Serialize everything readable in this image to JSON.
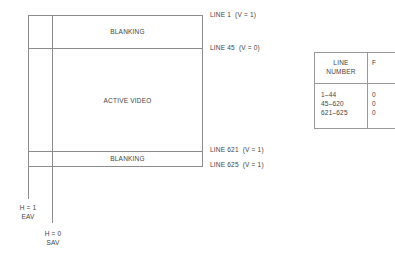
{
  "diagram": {
    "regions": {
      "top_blanking": "BLANKING",
      "active_video": "ACTIVE VIDEO",
      "bottom_blanking": "BLANKING"
    },
    "line_labels": [
      "LINE 1  (V = 1)",
      "LINE 45  (V = 0)",
      "LINE 621  (V = 1)",
      "LINE 625  (V = 1)"
    ],
    "h_markers": [
      {
        "value": "H = 1",
        "name": "EAV"
      },
      {
        "value": "H = 0",
        "name": "SAV"
      }
    ]
  },
  "table": {
    "headers": [
      "LINE NUMBER",
      "F"
    ],
    "header_line1": "LINE",
    "header_line2": "NUMBER",
    "rows": [
      {
        "line_number": "1–44",
        "f": "0"
      },
      {
        "line_number": "45–620",
        "f": "0"
      },
      {
        "line_number": "621–625",
        "f": "0"
      }
    ]
  }
}
